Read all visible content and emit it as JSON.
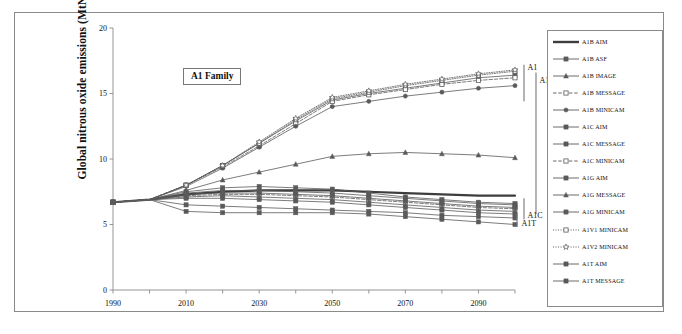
{
  "figure": {
    "family_label": "A1 Family"
  },
  "chart_data": {
    "type": "line",
    "title": "A1 Family",
    "xlabel": "",
    "ylabel": "Global nitrous oxide emissions (MtN/yr)",
    "xlim": [
      1990,
      2100
    ],
    "ylim": [
      0,
      20
    ],
    "xticks": [
      1990,
      2000,
      2010,
      2020,
      2030,
      2040,
      2050,
      2060,
      2070,
      2080,
      2090,
      2100
    ],
    "xtick_labels": [
      "1990",
      "",
      "2010",
      "",
      "2030",
      "",
      "2050",
      "",
      "2070",
      "",
      "2090",
      ""
    ],
    "yticks": [
      0,
      5,
      10,
      15,
      20
    ],
    "ytick_labels": [
      "0",
      "5",
      "10",
      "15",
      "20"
    ],
    "grid": false,
    "legend_position": "right-outside",
    "x": [
      1990,
      2000,
      2010,
      2020,
      2030,
      2040,
      2050,
      2060,
      2070,
      2080,
      2090,
      2100
    ],
    "series": [
      {
        "name": "A1B AIM",
        "marker": "none",
        "line": "solid",
        "linewidth": 2.2,
        "color": "#3d3d3d",
        "values": [
          6.7,
          6.9,
          7.3,
          7.5,
          7.6,
          7.6,
          7.6,
          7.5,
          7.4,
          7.3,
          7.2,
          7.2
        ]
      },
      {
        "name": "A1B ASF",
        "marker": "square",
        "line": "solid",
        "linewidth": 0.8,
        "color": "#5a5a5a",
        "values": [
          6.7,
          6.9,
          8.0,
          9.5,
          11.2,
          12.9,
          14.5,
          15.0,
          15.4,
          15.8,
          16.2,
          16.4
        ]
      },
      {
        "name": "A1B IMAGE",
        "marker": "triangle",
        "line": "solid",
        "linewidth": 0.8,
        "color": "#5a5a5a",
        "values": [
          6.7,
          6.9,
          7.6,
          8.4,
          9.0,
          9.6,
          10.2,
          10.4,
          10.5,
          10.4,
          10.3,
          10.1
        ]
      },
      {
        "name": "A1B MESSAGE",
        "marker": "square-open",
        "line": "dashed",
        "linewidth": 0.8,
        "color": "#5a5a5a",
        "values": [
          6.7,
          6.9,
          8.0,
          9.4,
          11.0,
          12.7,
          14.4,
          14.9,
          15.3,
          15.7,
          16.0,
          16.2
        ]
      },
      {
        "name": "A1B MINICAM",
        "marker": "circle",
        "line": "solid",
        "linewidth": 0.8,
        "color": "#5a5a5a",
        "values": [
          6.7,
          6.9,
          7.9,
          9.3,
          10.9,
          12.5,
          14.0,
          14.4,
          14.8,
          15.1,
          15.4,
          15.6
        ]
      },
      {
        "name": "A1C AIM",
        "marker": "square",
        "line": "solid",
        "linewidth": 0.8,
        "color": "#5a5a5a",
        "values": [
          6.7,
          6.9,
          7.4,
          7.6,
          7.6,
          7.5,
          7.4,
          7.2,
          7.0,
          6.8,
          6.6,
          6.5
        ]
      },
      {
        "name": "A1C MESSAGE",
        "marker": "square",
        "line": "solid",
        "linewidth": 0.8,
        "color": "#5a5a5a",
        "values": [
          6.7,
          6.9,
          7.5,
          7.8,
          7.9,
          7.8,
          7.7,
          7.4,
          7.1,
          6.9,
          6.7,
          6.6
        ]
      },
      {
        "name": "A1C MINICAM",
        "marker": "square-open",
        "line": "dashed",
        "linewidth": 0.8,
        "color": "#5a5a5a",
        "values": [
          6.7,
          6.9,
          7.2,
          7.3,
          7.3,
          7.2,
          7.1,
          6.9,
          6.7,
          6.5,
          6.3,
          6.2
        ]
      },
      {
        "name": "A1G AIM",
        "marker": "square",
        "line": "solid",
        "linewidth": 0.8,
        "color": "#5a5a5a",
        "values": [
          6.7,
          6.9,
          7.3,
          7.4,
          7.4,
          7.3,
          7.2,
          7.0,
          6.8,
          6.6,
          6.4,
          6.3
        ]
      },
      {
        "name": "A1G MESSAGE",
        "marker": "triangle",
        "line": "solid",
        "linewidth": 0.8,
        "color": "#5a5a5a",
        "values": [
          6.7,
          6.9,
          7.1,
          7.2,
          7.1,
          7.0,
          6.9,
          6.7,
          6.5,
          6.3,
          6.1,
          6.0
        ]
      },
      {
        "name": "A1G MINICAM",
        "marker": "square",
        "line": "solid",
        "linewidth": 0.8,
        "color": "#5a5a5a",
        "values": [
          6.7,
          6.9,
          7.0,
          7.0,
          6.9,
          6.8,
          6.7,
          6.5,
          6.3,
          6.1,
          5.9,
          5.8
        ]
      },
      {
        "name": "A1V1 MINICAM",
        "marker": "square-open",
        "line": "dotted",
        "linewidth": 0.8,
        "color": "#5a5a5a",
        "values": [
          6.7,
          6.9,
          8.0,
          9.5,
          11.2,
          13.0,
          14.6,
          15.1,
          15.6,
          16.0,
          16.4,
          16.7
        ]
      },
      {
        "name": "A1V2 MINICAM",
        "marker": "star-open",
        "line": "dotted",
        "linewidth": 0.8,
        "color": "#5a5a5a",
        "values": [
          6.7,
          6.9,
          8.0,
          9.5,
          11.3,
          13.1,
          14.7,
          15.2,
          15.7,
          16.1,
          16.5,
          16.8
        ]
      },
      {
        "name": "A1T AIM",
        "marker": "square",
        "line": "solid",
        "linewidth": 0.8,
        "color": "#5a5a5a",
        "values": [
          6.7,
          6.9,
          6.5,
          6.4,
          6.3,
          6.2,
          6.1,
          6.0,
          5.9,
          5.7,
          5.6,
          5.5
        ]
      },
      {
        "name": "A1T MESSAGE",
        "marker": "square",
        "line": "solid",
        "linewidth": 0.8,
        "color": "#5a5a5a",
        "values": [
          6.7,
          6.9,
          6.0,
          5.9,
          5.9,
          5.9,
          5.9,
          5.8,
          5.6,
          5.4,
          5.2,
          5.0
        ]
      }
    ],
    "annotations": [
      {
        "name": "A1",
        "label": "A1",
        "y_top": 14.4,
        "y_bottom": 17.2
      },
      {
        "name": "A1G",
        "label": "A1G",
        "y_top": 5.8,
        "y_bottom": 16.6
      },
      {
        "name": "A1C",
        "label": "A1C",
        "y_top": 5.4,
        "y_bottom": 7.0
      },
      {
        "name": "A1T",
        "label": "A1T",
        "y_top": 4.8,
        "y_bottom": 5.8
      }
    ]
  },
  "legend": {
    "items": [
      {
        "label": "A1B AIM",
        "marker": "none",
        "line": "solid",
        "thick": true
      },
      {
        "label": "A1B ASF",
        "marker": "square",
        "line": "solid",
        "thick": false
      },
      {
        "label": "A1B IMAGE",
        "marker": "triangle",
        "line": "solid",
        "thick": false
      },
      {
        "label": "A1B MESSAGE",
        "marker": "square-open",
        "line": "dashed",
        "thick": false
      },
      {
        "label": "A1B MINICAM",
        "marker": "circle",
        "line": "solid",
        "thick": false
      },
      {
        "label": "A1C AIM",
        "marker": "square",
        "line": "solid",
        "thick": false
      },
      {
        "label": "A1C MESSAGE",
        "marker": "square",
        "line": "solid",
        "thick": false
      },
      {
        "label": "A1C MINICAM",
        "marker": "square-open",
        "line": "dashed",
        "thick": false
      },
      {
        "label": "A1G AIM",
        "marker": "square",
        "line": "solid",
        "thick": false
      },
      {
        "label": "A1G MESSAGE",
        "marker": "triangle",
        "line": "solid",
        "thick": false
      },
      {
        "label": "A1G MINICAM",
        "marker": "square",
        "line": "solid",
        "thick": false
      },
      {
        "label": "A1V1 MINICAM",
        "marker": "square-open",
        "line": "dotted",
        "thick": false
      },
      {
        "label": "A1V2 MINICAM",
        "marker": "star-open",
        "line": "dotted",
        "thick": false
      },
      {
        "label": "A1T AIM",
        "marker": "square",
        "line": "solid",
        "thick": false
      },
      {
        "label": "A1T MESSAGE",
        "marker": "square",
        "line": "solid",
        "thick": false
      }
    ]
  }
}
